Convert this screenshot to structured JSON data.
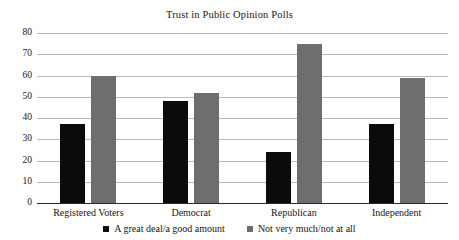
{
  "chart_data": {
    "type": "bar",
    "title": "Trust in Public Opinion Polls",
    "xlabel": "",
    "ylabel": "",
    "ylim": [
      0,
      80
    ],
    "ytick_step": 10,
    "yticks": [
      0,
      10,
      20,
      30,
      40,
      50,
      60,
      70,
      80
    ],
    "grid": true,
    "legend_position": "bottom",
    "categories": [
      "Registered Voters",
      "Democrat",
      "Republican",
      "Independent"
    ],
    "series": [
      {
        "name": "A great deal/a good amount",
        "color": "#0b0b0b",
        "values": [
          37,
          48,
          24,
          37
        ]
      },
      {
        "name": "Not very much/not at all",
        "color": "#6e6e6e",
        "values": [
          60,
          52,
          75,
          59
        ]
      }
    ]
  }
}
